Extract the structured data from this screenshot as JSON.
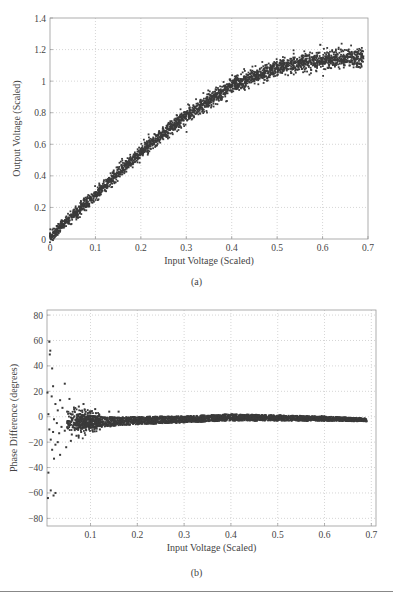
{
  "chart_data": [
    {
      "id": "a",
      "type": "scatter",
      "title": "",
      "caption": "(a)",
      "xlabel": "Input Voltage (Scaled)",
      "ylabel": "Output Voltage (Scaled)",
      "xlim": [
        0,
        0.7
      ],
      "ylim": [
        0,
        1.4
      ],
      "xticks": [
        0,
        0.1,
        0.2,
        0.3,
        0.4,
        0.5,
        0.6,
        0.7
      ],
      "xtick_labels": [
        "0",
        "0.1",
        "0.2",
        "0.3",
        "0.4",
        "0.5",
        "0.6",
        "0.7"
      ],
      "yticks": [
        0,
        0.2,
        0.4,
        0.6,
        0.8,
        1.0,
        1.2,
        1.4
      ],
      "ytick_labels": [
        "0",
        "0.2",
        "0.4",
        "0.6",
        "0.8",
        "1",
        "1.2",
        "1.4"
      ],
      "grid": true,
      "legend": null,
      "marker_color": "#3a3a3a",
      "trend": {
        "x": [
          0.0,
          0.05,
          0.1,
          0.15,
          0.2,
          0.25,
          0.3,
          0.35,
          0.4,
          0.45,
          0.5,
          0.55,
          0.6,
          0.65,
          0.69
        ],
        "y": [
          0.02,
          0.15,
          0.28,
          0.42,
          0.55,
          0.67,
          0.78,
          0.88,
          0.97,
          1.03,
          1.08,
          1.11,
          1.13,
          1.145,
          1.15
        ]
      },
      "noise_band": 0.03,
      "outliers": [
        {
          "x": 0.595,
          "y": 1.23
        },
        {
          "x": 0.64,
          "y": 1.2
        }
      ]
    },
    {
      "id": "b",
      "type": "scatter",
      "title": "",
      "caption": "(b)",
      "xlabel": "Input Voltage (Scaled)",
      "ylabel": "Phase Difference (degrees)",
      "xlim": [
        0.007,
        0.71
      ],
      "ylim": [
        -86,
        84
      ],
      "xticks": [
        0.1,
        0.2,
        0.3,
        0.4,
        0.5,
        0.6,
        0.7
      ],
      "xtick_labels": [
        "0.1",
        "0.2",
        "0.3",
        "0.4",
        "0.5",
        "0.6",
        "0.7"
      ],
      "yticks": [
        -80,
        -60,
        -40,
        -20,
        0,
        20,
        40,
        60,
        80
      ],
      "ytick_labels": [
        "−80",
        "−60",
        "−40",
        "−20",
        "0",
        "20",
        "40",
        "60",
        "80"
      ],
      "grid": true,
      "legend": null,
      "marker_color": "#3a3a3a",
      "trend": {
        "x": [
          0.07,
          0.1,
          0.15,
          0.2,
          0.3,
          0.4,
          0.5,
          0.6,
          0.69
        ],
        "y": [
          -3,
          -4,
          -4,
          -3,
          -2,
          -0.5,
          -1,
          -1.5,
          -2.5
        ]
      },
      "spread": {
        "x": [
          0.07,
          0.1,
          0.15,
          0.2,
          0.3,
          0.4,
          0.5,
          0.6,
          0.69
        ],
        "half_width": [
          6,
          5,
          3.5,
          3,
          2.5,
          2.5,
          2.2,
          1.8,
          1.2
        ]
      },
      "low_voltage_outliers": [
        {
          "x": 0.012,
          "y": 59
        },
        {
          "x": 0.014,
          "y": 52
        },
        {
          "x": 0.013,
          "y": 49
        },
        {
          "x": 0.018,
          "y": 38
        },
        {
          "x": 0.02,
          "y": 24
        },
        {
          "x": 0.045,
          "y": 26
        },
        {
          "x": 0.008,
          "y": 19
        },
        {
          "x": 0.017,
          "y": 16
        },
        {
          "x": 0.035,
          "y": 13
        },
        {
          "x": 0.055,
          "y": 14
        },
        {
          "x": 0.025,
          "y": 10
        },
        {
          "x": 0.04,
          "y": 7
        },
        {
          "x": 0.03,
          "y": 5
        },
        {
          "x": 0.05,
          "y": 4
        },
        {
          "x": 0.065,
          "y": 6
        },
        {
          "x": 0.01,
          "y": 2
        },
        {
          "x": 0.022,
          "y": -2
        },
        {
          "x": 0.028,
          "y": -5
        },
        {
          "x": 0.038,
          "y": -8
        },
        {
          "x": 0.012,
          "y": -10
        },
        {
          "x": 0.02,
          "y": -12
        },
        {
          "x": 0.033,
          "y": -13
        },
        {
          "x": 0.045,
          "y": -11
        },
        {
          "x": 0.06,
          "y": -14
        },
        {
          "x": 0.015,
          "y": -18
        },
        {
          "x": 0.03,
          "y": -20
        },
        {
          "x": 0.025,
          "y": -22
        },
        {
          "x": 0.048,
          "y": -24
        },
        {
          "x": 0.018,
          "y": -26
        },
        {
          "x": 0.035,
          "y": -30
        },
        {
          "x": 0.022,
          "y": -33
        },
        {
          "x": 0.01,
          "y": -44
        },
        {
          "x": 0.015,
          "y": -58
        },
        {
          "x": 0.021,
          "y": -62
        },
        {
          "x": 0.009,
          "y": -64
        },
        {
          "x": 0.025,
          "y": -60
        },
        {
          "x": 0.058,
          "y": -19
        },
        {
          "x": 0.07,
          "y": -15
        },
        {
          "x": 0.08,
          "y": -12
        },
        {
          "x": 0.085,
          "y": 10
        },
        {
          "x": 0.075,
          "y": 8
        },
        {
          "x": 0.09,
          "y": -10
        },
        {
          "x": 0.11,
          "y": 6
        },
        {
          "x": 0.12,
          "y": -10
        },
        {
          "x": 0.14,
          "y": 4
        },
        {
          "x": 0.16,
          "y": 4
        }
      ]
    }
  ],
  "figure": {
    "caption_a": "(a)",
    "caption_b": "(b)"
  }
}
